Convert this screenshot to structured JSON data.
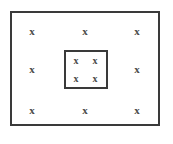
{
  "figure": {
    "background_color": "#ffffff",
    "stroke_color": "#3a3a3a",
    "marker_color": "#4a4a4a",
    "marker_glyph": "x"
  },
  "outer_rectangle": {
    "name": "outer-rectangle",
    "x": 10,
    "y": 11,
    "width": 150,
    "height": 115,
    "border_width": 2
  },
  "inner_rectangle": {
    "name": "inner-rectangle",
    "x": 64,
    "y": 50,
    "width": 44,
    "height": 39,
    "border_width": 2
  },
  "outer_markers": [
    {
      "label": "x",
      "position": "top-left",
      "x": 32,
      "y": 31
    },
    {
      "label": "x",
      "position": "top-center",
      "x": 85,
      "y": 31
    },
    {
      "label": "x",
      "position": "top-right",
      "x": 137,
      "y": 31
    },
    {
      "label": "x",
      "position": "middle-left",
      "x": 32,
      "y": 69
    },
    {
      "label": "x",
      "position": "middle-right",
      "x": 137,
      "y": 69
    },
    {
      "label": "x",
      "position": "bottom-left",
      "x": 32,
      "y": 110
    },
    {
      "label": "x",
      "position": "bottom-center",
      "x": 85,
      "y": 110
    },
    {
      "label": "x",
      "position": "bottom-right",
      "x": 137,
      "y": 110
    }
  ],
  "inner_markers": [
    {
      "label": "x",
      "position": "top-left",
      "x": 76,
      "y": 61
    },
    {
      "label": "x",
      "position": "top-right",
      "x": 95,
      "y": 61
    },
    {
      "label": "x",
      "position": "bottom-left",
      "x": 76,
      "y": 79
    },
    {
      "label": "x",
      "position": "bottom-right",
      "x": 95,
      "y": 79
    }
  ],
  "counts": {
    "outer_marker_count": 8,
    "inner_marker_count": 4,
    "total_marker_count": 12
  }
}
